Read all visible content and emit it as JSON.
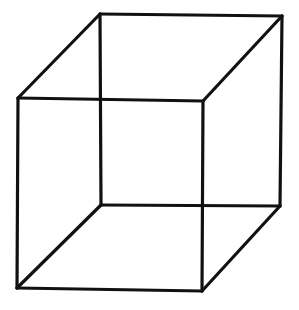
{
  "diagram": {
    "type": "necker-cube",
    "line_color": "#111111",
    "background": "#ffffff",
    "vertices": {
      "front_top_left": [
        18,
        98
      ],
      "front_top_right": [
        203,
        101
      ],
      "front_bottom_left": [
        17,
        288
      ],
      "front_bottom_right": [
        202,
        291
      ],
      "back_top_left": [
        100,
        14
      ],
      "back_top_right": [
        282,
        16
      ],
      "back_bottom_left": [
        101,
        205
      ],
      "back_bottom_right": [
        280,
        206
      ]
    },
    "edges": [
      [
        "front_top_left",
        "front_top_right"
      ],
      [
        "front_top_right",
        "front_bottom_right"
      ],
      [
        "front_bottom_right",
        "front_bottom_left"
      ],
      [
        "front_bottom_left",
        "front_top_left"
      ],
      [
        "back_top_left",
        "back_top_right"
      ],
      [
        "back_top_right",
        "back_bottom_right"
      ],
      [
        "back_bottom_right",
        "back_bottom_left"
      ],
      [
        "back_bottom_left",
        "back_top_left"
      ],
      [
        "front_top_left",
        "back_top_left"
      ],
      [
        "front_top_right",
        "back_top_right"
      ],
      [
        "front_bottom_left",
        "back_bottom_left"
      ],
      [
        "front_bottom_right",
        "back_bottom_right"
      ]
    ]
  }
}
